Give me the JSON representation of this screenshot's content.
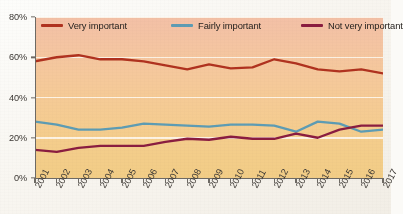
{
  "chart_data": {
    "type": "line",
    "title": "",
    "xlabel": "",
    "ylabel": "",
    "ylim": [
      0,
      80
    ],
    "ytick_labels": [
      "0%",
      "20%",
      "40%",
      "60%",
      "80%"
    ],
    "ytick_values": [
      0,
      20,
      40,
      60,
      80
    ],
    "grid": true,
    "grid_axis": "y",
    "legend_position": "top-inside",
    "categories": [
      "2001",
      "2002",
      "2003",
      "2004",
      "2005",
      "2006",
      "2007",
      "2008",
      "2009",
      "2010",
      "2011",
      "2012",
      "2013",
      "2014",
      "2015",
      "2016",
      "2017"
    ],
    "series": [
      {
        "name": "Very important",
        "color": "#b0321f",
        "values": [
          58,
          60,
          61,
          59,
          59,
          58,
          56,
          54,
          56.5,
          54.5,
          55,
          59,
          57,
          54,
          53,
          54,
          52
        ]
      },
      {
        "name": "Fairly important",
        "color": "#5d9cb4",
        "values": [
          28,
          26.5,
          24,
          24,
          25,
          27,
          26.5,
          26,
          25.5,
          26.5,
          26.5,
          26,
          23,
          28,
          27,
          23,
          24
        ]
      },
      {
        "name": "Not very important",
        "color": "#8a1d40",
        "values": [
          14,
          13,
          15,
          16,
          16,
          16,
          18,
          19.5,
          19,
          20.5,
          19.5,
          19.5,
          22,
          20,
          24,
          26,
          26
        ]
      }
    ]
  },
  "legend": {
    "items": [
      {
        "label": "Very important",
        "color": "#b0321f"
      },
      {
        "label": "Fairly important",
        "color": "#5d9cb4"
      },
      {
        "label": "Not very important",
        "color": "#8a1d40"
      }
    ]
  },
  "axes": {
    "y": {
      "ticks": [
        "0%",
        "20%",
        "40%",
        "60%",
        "80%"
      ]
    },
    "x": {
      "ticks": [
        "2001",
        "2002",
        "2003",
        "2004",
        "2005",
        "2006",
        "2007",
        "2008",
        "2009",
        "2010",
        "2011",
        "2012",
        "2013",
        "2014",
        "2015",
        "2016",
        "2017"
      ]
    }
  },
  "style": {
    "plot_bg_top": "#f3c0a6",
    "plot_bg_bottom": "#f2cd86",
    "gridline_color": "#fdf6ec",
    "axis_color": "#6e6a64",
    "text_color": "#3b3733"
  }
}
